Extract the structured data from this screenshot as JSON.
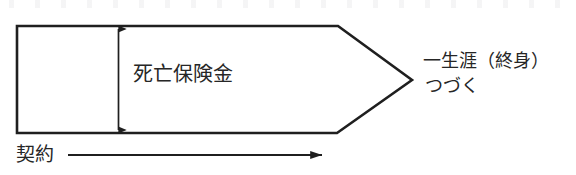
{
  "figure": {
    "type": "insurance-coverage-timeline-diagram",
    "background_color": "#ffffff",
    "stroke_color": "#1f1f1f",
    "text_color": "#262626",
    "labels": {
      "benefit": "死亡保険金",
      "lifetime": "一生涯（終身）",
      "continues": "つづく",
      "contract": "契約"
    }
  },
  "shapes": {
    "coverage_band": {
      "name": "pentagon-coverage-band",
      "points": "17,26 338,26 412,80 337,133 17,133",
      "fill": "none"
    },
    "benefit_arrow": {
      "name": "vertical-double-arrow",
      "x": 118,
      "y_top": 27,
      "y_bottom": 132,
      "double_headed": true
    },
    "time_axis": {
      "name": "horizontal-time-arrow",
      "x_start": 68,
      "x_end": 334,
      "y": 155,
      "double_headed": false
    }
  }
}
